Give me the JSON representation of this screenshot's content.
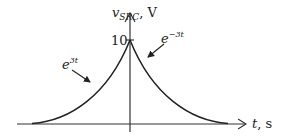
{
  "figure": {
    "type": "diagram",
    "y_axis": {
      "label_main": "v",
      "label_sub": "SRC",
      "label_unit": ", V"
    },
    "x_axis": {
      "label_main": "t",
      "label_unit": ", s"
    },
    "peak_value_label": "10",
    "left_curve": {
      "label_base": "e",
      "label_exp": "3t"
    },
    "right_curve": {
      "label_base": "e",
      "label_exp": "−3t"
    },
    "colors": {
      "line": "#222222",
      "background": "#ffffff"
    }
  }
}
